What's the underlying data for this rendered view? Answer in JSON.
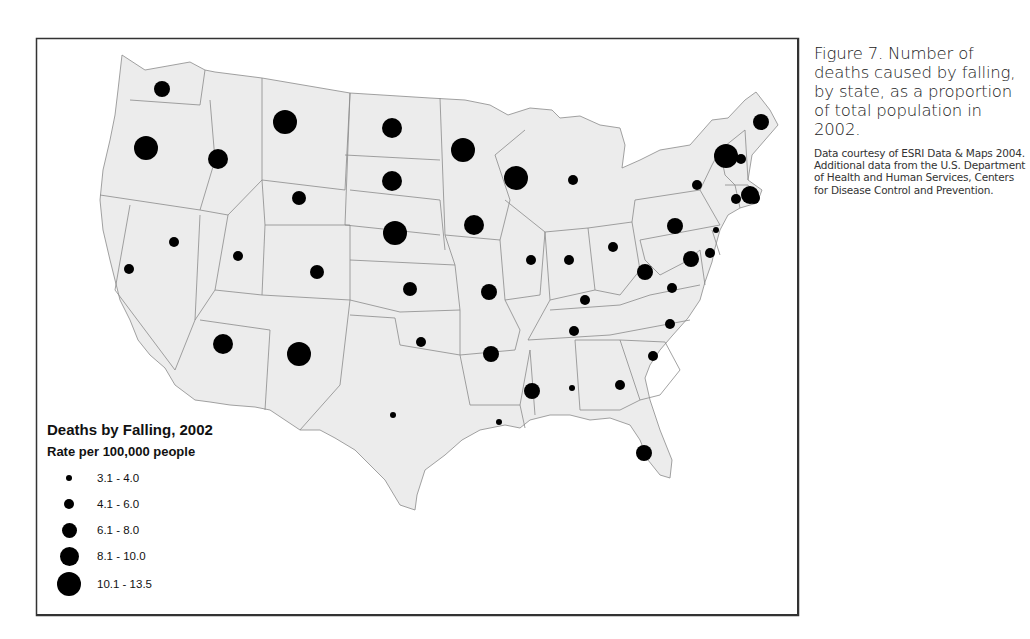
{
  "caption": {
    "title": "Figure 7. Number of deaths caused by falling, by state, as a proportion of total population in 2002.",
    "source": "Data courtesy of ESRI Data & Maps 2004. Additional data from the U.S. Department of Health and Human Services, Centers for Disease Control and Prevention."
  },
  "legend": {
    "title": "Deaths by Falling, 2002",
    "subtitle": "Rate per 100,000 people",
    "classes": [
      {
        "label": "3.1 - 4.0",
        "radius": 3
      },
      {
        "label": "4.1 - 6.0",
        "radius": 5
      },
      {
        "label": "6.1 - 8.0",
        "radius": 7
      },
      {
        "label": "8.1 - 10.0",
        "radius": 9
      },
      {
        "label": "10.1 - 13.5",
        "radius": 12
      }
    ]
  },
  "colors": {
    "land": "#ececec",
    "border": "#8a8a8a",
    "dot": "#000000",
    "frame": "#333333"
  },
  "chart_data": {
    "type": "proportional-symbol-map",
    "title": "Deaths by Falling, 2002",
    "subtitle": "Rate per 100,000 people",
    "legend_position": "bottom-left",
    "classes": [
      "3.1 - 4.0",
      "4.1 - 6.0",
      "6.1 - 8.0",
      "8.1 - 10.0",
      "10.1 - 13.5"
    ],
    "states": [
      {
        "state": "WA",
        "x": 162,
        "y": 89,
        "class": "4.1 - 6.0",
        "r": 8
      },
      {
        "state": "OR",
        "x": 146,
        "y": 148,
        "class": "10.1 - 13.5",
        "r": 12
      },
      {
        "state": "ID",
        "x": 218,
        "y": 159,
        "class": "6.1 - 8.0",
        "r": 10
      },
      {
        "state": "MT",
        "x": 285,
        "y": 122,
        "class": "10.1 - 13.5",
        "r": 12
      },
      {
        "state": "WY",
        "x": 299,
        "y": 198,
        "class": "4.1 - 6.0",
        "r": 7
      },
      {
        "state": "CA",
        "x": 129,
        "y": 269,
        "class": "3.1 - 4.0",
        "r": 5
      },
      {
        "state": "NV",
        "x": 174,
        "y": 242,
        "class": "3.1 - 4.0",
        "r": 5
      },
      {
        "state": "UT",
        "x": 238,
        "y": 256,
        "class": "3.1 - 4.0",
        "r": 5
      },
      {
        "state": "CO",
        "x": 317,
        "y": 272,
        "class": "4.1 - 6.0",
        "r": 7
      },
      {
        "state": "AZ",
        "x": 223,
        "y": 344,
        "class": "6.1 - 8.0",
        "r": 10
      },
      {
        "state": "NM",
        "x": 299,
        "y": 354,
        "class": "10.1 - 13.5",
        "r": 12
      },
      {
        "state": "ND",
        "x": 392,
        "y": 128,
        "class": "6.1 - 8.0",
        "r": 10
      },
      {
        "state": "SD",
        "x": 392,
        "y": 181,
        "class": "6.1 - 8.0",
        "r": 10
      },
      {
        "state": "NE",
        "x": 395,
        "y": 233,
        "class": "10.1 - 13.5",
        "r": 12
      },
      {
        "state": "KS",
        "x": 410,
        "y": 289,
        "class": "4.1 - 6.0",
        "r": 7
      },
      {
        "state": "OK",
        "x": 421,
        "y": 342,
        "class": "3.1 - 4.0",
        "r": 5
      },
      {
        "state": "TX",
        "x": 393,
        "y": 415,
        "class": "3.1 - 4.0",
        "r": 3
      },
      {
        "state": "MN",
        "x": 463,
        "y": 150,
        "class": "10.1 - 13.5",
        "r": 12
      },
      {
        "state": "IA",
        "x": 474,
        "y": 225,
        "class": "6.1 - 8.0",
        "r": 10
      },
      {
        "state": "MO",
        "x": 489,
        "y": 292,
        "class": "4.1 - 6.0",
        "r": 8
      },
      {
        "state": "AR",
        "x": 491,
        "y": 354,
        "class": "4.1 - 6.0",
        "r": 8
      },
      {
        "state": "LA",
        "x": 499,
        "y": 422,
        "class": "3.1 - 4.0",
        "r": 3
      },
      {
        "state": "WI",
        "x": 516,
        "y": 178,
        "class": "10.1 - 13.5",
        "r": 12
      },
      {
        "state": "IL",
        "x": 531,
        "y": 260,
        "class": "3.1 - 4.0",
        "r": 5
      },
      {
        "state": "MI",
        "x": 573,
        "y": 180,
        "class": "3.1 - 4.0",
        "r": 5
      },
      {
        "state": "IN",
        "x": 569,
        "y": 260,
        "class": "3.1 - 4.0",
        "r": 5
      },
      {
        "state": "OH",
        "x": 613,
        "y": 247,
        "class": "3.1 - 4.0",
        "r": 5
      },
      {
        "state": "KY",
        "x": 585,
        "y": 300,
        "class": "3.1 - 4.0",
        "r": 5
      },
      {
        "state": "TN",
        "x": 574,
        "y": 331,
        "class": "3.1 - 4.0",
        "r": 5
      },
      {
        "state": "MS",
        "x": 532,
        "y": 391,
        "class": "4.1 - 6.0",
        "r": 8
      },
      {
        "state": "AL",
        "x": 572,
        "y": 388,
        "class": "3.1 - 4.0",
        "r": 3
      },
      {
        "state": "GA",
        "x": 620,
        "y": 385,
        "class": "3.1 - 4.0",
        "r": 5
      },
      {
        "state": "FL",
        "x": 644,
        "y": 453,
        "class": "4.1 - 6.0",
        "r": 8
      },
      {
        "state": "SC",
        "x": 653,
        "y": 356,
        "class": "3.1 - 4.0",
        "r": 5
      },
      {
        "state": "NC",
        "x": 670,
        "y": 324,
        "class": "3.1 - 4.0",
        "r": 5
      },
      {
        "state": "WV",
        "x": 645,
        "y": 272,
        "class": "4.1 - 6.0",
        "r": 8
      },
      {
        "state": "VA",
        "x": 672,
        "y": 288,
        "class": "3.1 - 4.0",
        "r": 5
      },
      {
        "state": "PA",
        "x": 675,
        "y": 226,
        "class": "4.1 - 6.0",
        "r": 8
      },
      {
        "state": "MD",
        "x": 691,
        "y": 259,
        "class": "6.1 - 8.0",
        "r": 8
      },
      {
        "state": "DE",
        "x": 710,
        "y": 253,
        "class": "3.1 - 4.0",
        "r": 5
      },
      {
        "state": "NJ",
        "x": 716,
        "y": 230,
        "class": "3.1 - 4.0",
        "r": 3
      },
      {
        "state": "NY",
        "x": 697,
        "y": 185,
        "class": "3.1 - 4.0",
        "r": 5
      },
      {
        "state": "VT",
        "x": 726,
        "y": 156,
        "class": "10.1 - 13.5",
        "r": 12
      },
      {
        "state": "NH",
        "x": 741,
        "y": 159,
        "class": "3.1 - 4.0",
        "r": 5
      },
      {
        "state": "ME",
        "x": 761,
        "y": 122,
        "class": "4.1 - 6.0",
        "r": 8
      },
      {
        "state": "MA",
        "x": 750,
        "y": 195,
        "class": "6.1 - 8.0",
        "r": 9
      },
      {
        "state": "CT",
        "x": 736,
        "y": 199,
        "class": "3.1 - 4.0",
        "r": 5
      },
      {
        "state": "RI",
        "x": 754,
        "y": 198,
        "class": "3.1 - 4.0",
        "r": 6
      }
    ]
  }
}
